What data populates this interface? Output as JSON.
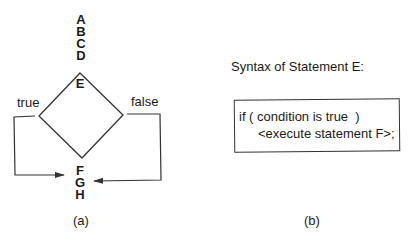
{
  "panel_a": {
    "top_statements": [
      "A",
      "B",
      "C",
      "D"
    ],
    "decision_label": "E",
    "true_label": "true",
    "false_label": "false",
    "bottom_statements": [
      "F",
      "G",
      "H"
    ],
    "caption": "(a)"
  },
  "panel_b": {
    "title": "Syntax of Statement E:",
    "code_line_1": "if ( condition is true  )",
    "code_line_2": "<execute statement F>;",
    "caption": "(b)"
  },
  "colors": {
    "stroke": "#333333",
    "text": "#1a1a1a"
  }
}
